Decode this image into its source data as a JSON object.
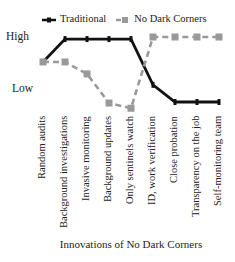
{
  "chart_data": {
    "type": "line",
    "title": "",
    "xlabel": "Innovations of No Dark Corners",
    "ylabel": "",
    "categories": [
      "Random audits",
      "Background investigations",
      "Invasive monitoring",
      "Background updates",
      "Only sentinels watch",
      "ID, work verification",
      "Close probation",
      "Transparency on the job",
      "Self-monitoring team"
    ],
    "y_tick_labels": [
      "High",
      "Low"
    ],
    "y_scale_note": "Qualitative scale: High = 1.0, Low = 0.0",
    "ylim": [
      -0.5,
      1.1
    ],
    "grid": false,
    "legend_position": "top",
    "series": [
      {
        "name": "Traditional",
        "style": "solid",
        "color": "#111111",
        "marker": "diamond",
        "values": [
          0.52,
          0.96,
          0.96,
          0.96,
          0.96,
          0.08,
          -0.25,
          -0.25,
          -0.25
        ]
      },
      {
        "name": "No Dark Corners",
        "style": "dashed",
        "color": "#999999",
        "marker": "square",
        "values": [
          0.52,
          0.52,
          0.29,
          -0.27,
          -0.37,
          1.0,
          1.0,
          1.0,
          1.0
        ]
      }
    ]
  },
  "legend": {
    "traditional": "Traditional",
    "ndc": "No Dark Corners"
  },
  "axis": {
    "high": "High",
    "low": "Low",
    "xtitle": "Innovations of No Dark Corners"
  }
}
